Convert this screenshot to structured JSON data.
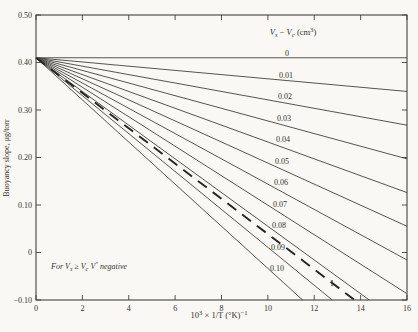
{
  "figure": {
    "background": "#f9f8f4",
    "line_color": "#43423e",
    "dashed_color": "#26241f",
    "text_color": "#35332e"
  },
  "chart_data": {
    "type": "line",
    "title": "",
    "ylabel": "Buoyancy slope, μg/torr",
    "xlabel_parts": [
      {
        "t": "10"
      },
      {
        "t": "3",
        "sup": true
      },
      {
        "t": " × 1/T (°K)"
      },
      {
        "t": "−1",
        "sup": true
      }
    ],
    "xlim": [
      0,
      16
    ],
    "ylim": [
      -0.1,
      0.5
    ],
    "x_tick_values": [
      0,
      2,
      4,
      6,
      8,
      10,
      12,
      14,
      16
    ],
    "x_tick_labels": [
      "0",
      "2",
      "4",
      "6",
      "8",
      "10",
      "12",
      "14",
      "16"
    ],
    "y_tick_values": [
      0.5,
      0.4,
      0.3,
      0.2,
      0.1,
      0,
      -0.1
    ],
    "y_tick_labels": [
      "0.50",
      "0.40",
      "0.30",
      "0.20",
      "0.10",
      "0",
      "−0.10"
    ],
    "grid": false,
    "common_point": {
      "x": 0,
      "y": 0.41
    },
    "slope_coefficient_per_cm3": 0.4435,
    "series": [
      {
        "label": "0",
        "dv": 0.0
      },
      {
        "label": "0.01",
        "dv": 0.01
      },
      {
        "label": "0.02",
        "dv": 0.02
      },
      {
        "label": "0.03",
        "dv": 0.03
      },
      {
        "label": "0.04",
        "dv": 0.04
      },
      {
        "label": "0.05",
        "dv": 0.05
      },
      {
        "label": "0.06",
        "dv": 0.06
      },
      {
        "label": "0.07",
        "dv": 0.07
      },
      {
        "label": "0.08",
        "dv": 0.08
      },
      {
        "label": "0.09",
        "dv": 0.09
      },
      {
        "label": "0.10",
        "dv": 0.1
      }
    ],
    "dashed_series": {
      "label": "I",
      "dv": 0.0837
    },
    "legend_title_parts": [
      {
        "t": "V",
        "i": true
      },
      {
        "t": "s",
        "sub": true,
        "i": true
      },
      {
        "t": " − "
      },
      {
        "t": "V",
        "i": true
      },
      {
        "t": "c",
        "sub": true,
        "i": true
      },
      {
        "t": " (cm"
      },
      {
        "t": "3",
        "sup": true
      },
      {
        "t": ")"
      }
    ],
    "footnote_parts": [
      {
        "t": "For ",
        "i": true
      },
      {
        "t": "V",
        "i": true
      },
      {
        "t": "s",
        "sub": true,
        "i": true
      },
      {
        "t": " ≥ ",
        "i": true
      },
      {
        "t": "V",
        "i": true
      },
      {
        "t": "c",
        "sub": true,
        "i": true
      },
      {
        "t": " ",
        "i": true
      },
      {
        "t": "V",
        "i": true
      },
      {
        "t": "″",
        "sup": true,
        "i": true
      },
      {
        "t": " negative",
        "i": true
      }
    ]
  }
}
